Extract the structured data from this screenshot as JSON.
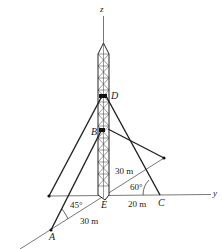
{
  "diagram": {
    "type": "3d-statics-tower",
    "axes": {
      "z_label": "z",
      "y_label": "y"
    },
    "points": {
      "D": "D",
      "B": "B",
      "E": "E",
      "C": "C",
      "A": "A"
    },
    "dimensions": {
      "ec": "20 m",
      "ea": "30 m",
      "e_right": "30 m"
    },
    "angles": {
      "angle_a": "45°",
      "angle_c": "60°"
    },
    "colors": {
      "line": "#222222",
      "axis": "#555555"
    }
  }
}
